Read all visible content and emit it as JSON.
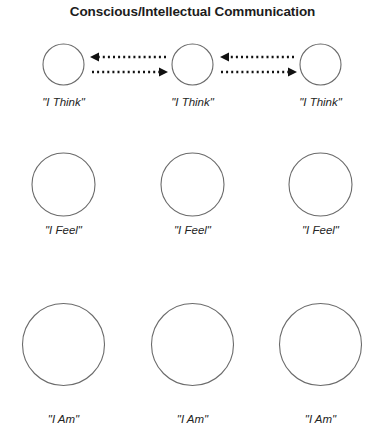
{
  "title": "Conscious/Intellectual Communication",
  "colors": {
    "background": "#ffffff",
    "circle_stroke": "#6b6b6b",
    "arrow": "#111111",
    "title_text": "#1c1c1c",
    "label_text": "#242424"
  },
  "diagram": {
    "type": "concentric-level-diagram",
    "columns": 3,
    "rows": [
      {
        "level": "conscious-intellectual",
        "label": "\"I Think\"",
        "circle_diameter": 41,
        "has_arrows": true,
        "nodes": [
          {
            "label": "\"I Think\"",
            "cx": 63.5,
            "cy": 64.5
          },
          {
            "label": "\"I Think\"",
            "cx": 192.5,
            "cy": 64.5
          },
          {
            "label": "\"I Think\"",
            "cx": 320.5,
            "cy": 64.5
          }
        ],
        "label_y": 96
      },
      {
        "level": "emotional",
        "label": "\"I Feel\"",
        "circle_diameter": 63,
        "has_arrows": false,
        "nodes": [
          {
            "label": "\"I Feel\"",
            "cx": 63.5,
            "cy": 184.5
          },
          {
            "label": "\"I Feel\"",
            "cx": 192.5,
            "cy": 184.5
          },
          {
            "label": "\"I Feel\"",
            "cx": 320.5,
            "cy": 184.5
          }
        ],
        "label_y": 224
      },
      {
        "level": "being",
        "label": "\"I Am\"",
        "circle_diameter": 82,
        "has_arrows": false,
        "nodes": [
          {
            "label": "\"I Am\"",
            "cx": 63.5,
            "cy": 344.5
          },
          {
            "label": "\"I Am\"",
            "cx": 192.5,
            "cy": 344.5
          },
          {
            "label": "\"I Am\"",
            "cx": 320.5,
            "cy": 344.5
          }
        ],
        "label_y": 413
      }
    ],
    "arrow_pairs": [
      {
        "name": "arrows-left-middle",
        "from_node": 0,
        "to_node": 1,
        "leftward": {
          "x_start": 166,
          "x_end": 92,
          "y": 57,
          "direction": "left"
        },
        "rightward": {
          "x_start": 90,
          "x_end": 168,
          "y": 72,
          "direction": "right"
        }
      },
      {
        "name": "arrows-middle-right",
        "from_node": 1,
        "to_node": 2,
        "leftward": {
          "x_start": 294,
          "x_end": 221,
          "y": 57,
          "direction": "left"
        },
        "rightward": {
          "x_start": 219,
          "x_end": 297,
          "y": 72,
          "direction": "right"
        }
      }
    ]
  }
}
